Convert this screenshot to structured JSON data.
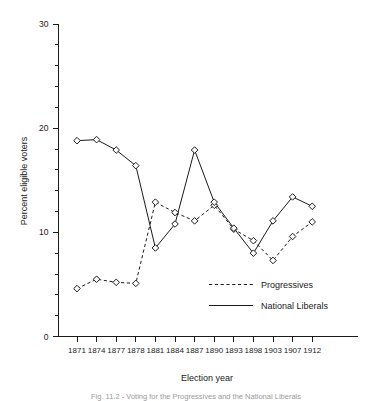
{
  "chart_data": {
    "type": "line",
    "title": "",
    "subtitle": "",
    "xlabel": "Election year",
    "ylabel": "Percent eligible voters",
    "categories": [
      "1871",
      "1874",
      "1877",
      "1878",
      "1881",
      "1884",
      "1887",
      "1890",
      "1893",
      "1898",
      "1903",
      "1907",
      "1912"
    ],
    "ylim": [
      0,
      30
    ],
    "ytick_major": [
      0,
      10,
      20,
      30
    ],
    "ytick_minor": [
      2,
      4,
      6,
      8,
      12,
      14,
      16,
      18,
      22,
      24,
      26,
      28
    ],
    "grid": false,
    "legend_position": "inside-lower-right",
    "series": [
      {
        "name": "Progressives",
        "style": "dashed",
        "marker": "diamond",
        "values": [
          4.6,
          5.5,
          5.2,
          5.1,
          12.9,
          11.9,
          11.1,
          12.6,
          10.3,
          9.2,
          7.3,
          9.6,
          11.0
        ]
      },
      {
        "name": "National Liberals",
        "style": "solid",
        "marker": "diamond",
        "values": [
          18.8,
          18.9,
          17.9,
          16.4,
          8.5,
          10.8,
          17.9,
          12.9,
          10.4,
          8.0,
          11.1,
          13.4,
          12.5
        ]
      }
    ]
  },
  "axes": {
    "y_title": "Percent eligible voters",
    "x_title": "Election year"
  },
  "legend": {
    "items": [
      {
        "label": "Progressives",
        "style": "dashed"
      },
      {
        "label": "National Liberals",
        "style": "solid"
      }
    ]
  },
  "caption": {
    "text": "Fig. 11.2 - Voting for the Progressives and the National Liberals"
  },
  "colors": {
    "ink": "#1a1a1a",
    "background": "#ffffff",
    "marker_fill": "#ffffff",
    "caption": "#9a9a9a"
  }
}
